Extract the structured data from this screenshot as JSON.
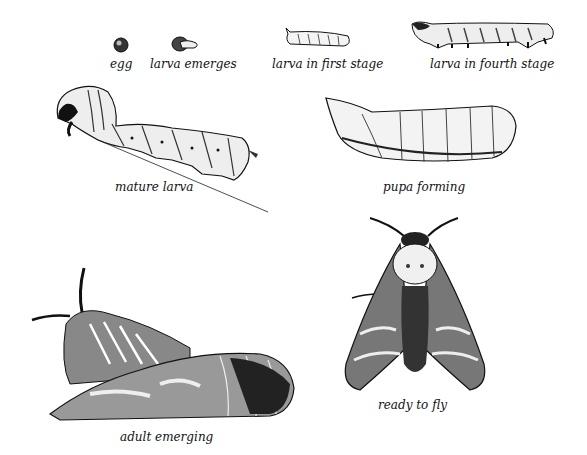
{
  "stages": [
    {
      "id": "egg",
      "label": "egg"
    },
    {
      "id": "larva-emerges",
      "label": "larva emerges"
    },
    {
      "id": "larva-first-stage",
      "label": "larva in first stage"
    },
    {
      "id": "larva-fourth-stage",
      "label": "larva in fourth stage"
    },
    {
      "id": "mature-larva",
      "label": "mature larva"
    },
    {
      "id": "pupa-forming",
      "label": "pupa forming"
    },
    {
      "id": "adult-emerging",
      "label": "adult emerging"
    },
    {
      "id": "ready-to-fly",
      "label": "ready to fly"
    }
  ],
  "colors": {
    "ink": "#111111",
    "paper": "#ffffff",
    "shade": "#555555",
    "light": "#dddddd"
  }
}
